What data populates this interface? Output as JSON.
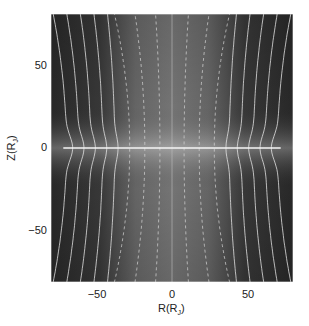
{
  "chart_data": {
    "type": "heatmap",
    "title": "",
    "xlabel": "R(R_J)",
    "ylabel": "Z(R_J)",
    "xlabel_main": "R(R",
    "xlabel_sub": "J",
    "xlabel_close": ")",
    "ylabel_main": "Z(R",
    "ylabel_sub": "J",
    "ylabel_close": ")",
    "xlim": [
      -80,
      80
    ],
    "ylim": [
      -81,
      81
    ],
    "x_ticks": [
      -50,
      0,
      50
    ],
    "y_ticks": [
      -50,
      0,
      50
    ],
    "x_tick_labels": [
      "−50",
      "0",
      "50"
    ],
    "y_tick_labels": [
      "50",
      "0",
      "−50"
    ],
    "grid": false,
    "colormap": "grayscale",
    "field_lines_solid_R_at_equator": [
      -70,
      -62,
      -54,
      -46,
      -38,
      38,
      46,
      54,
      62,
      70
    ],
    "field_lines_dashed_R_at_equator": [
      -28,
      -18,
      -8,
      8,
      18,
      28
    ],
    "equatorial_sheet": {
      "z": 0,
      "r_range": [
        -72,
        72
      ]
    },
    "axis_line": {
      "r": 0
    }
  },
  "labels": {
    "xticks": [
      "−50",
      "0",
      "50"
    ],
    "yticks": [
      "50",
      "0",
      "−50"
    ]
  }
}
